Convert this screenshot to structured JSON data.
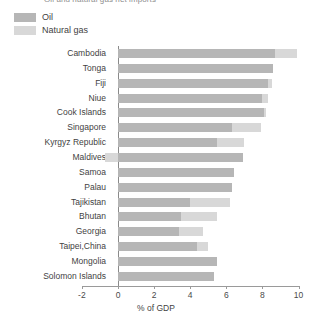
{
  "title": {
    "text": "Oil and natural gas net imports"
  },
  "legend": {
    "position": "top-left",
    "items": [
      {
        "label": "Oil",
        "color": "#b6b6b6",
        "key": "oil"
      },
      {
        "label": "Natural gas",
        "color": "#d8d8d8",
        "key": "gas"
      }
    ]
  },
  "axis": {
    "x_label": "% of GDP",
    "ticks": [
      "-2",
      "0",
      "2",
      "4",
      "6",
      "8",
      "10"
    ],
    "min": -2,
    "max": 10,
    "step": 2
  },
  "chart_data": {
    "type": "bar",
    "orientation": "horizontal",
    "stacked": true,
    "title": "Oil and natural gas net imports",
    "xlabel": "% of GDP",
    "ylabel": "",
    "xlim": [
      -2,
      10
    ],
    "grid": false,
    "legend_position": "top-left",
    "categories": [
      "Cambodia",
      "Tonga",
      "Fiji",
      "Niue",
      "Cook Islands",
      "Singapore",
      "Kyrgyz Republic",
      "Maldives",
      "Samoa",
      "Palau",
      "Tajikistan",
      "Bhutan",
      "Georgia",
      "Taipei,China",
      "Mongolia",
      "Solomon Islands"
    ],
    "series": [
      {
        "name": "Oil",
        "color": "#b6b6b6",
        "values": [
          8.7,
          8.6,
          8.3,
          8.0,
          8.1,
          6.3,
          5.5,
          6.9,
          6.4,
          6.3,
          4.0,
          3.5,
          3.4,
          4.4,
          5.5,
          5.3
        ]
      },
      {
        "name": "Natural gas",
        "color": "#d8d8d8",
        "values": [
          1.2,
          0.0,
          0.25,
          0.3,
          0.1,
          1.6,
          1.5,
          -0.7,
          0.0,
          0.0,
          2.2,
          2.0,
          1.3,
          0.6,
          0.0,
          0.0
        ]
      }
    ],
    "totals": [
      9.9,
      8.6,
      8.55,
      8.3,
      8.2,
      7.9,
      7.0,
      6.2,
      6.4,
      6.3,
      6.2,
      5.5,
      4.7,
      5.0,
      5.5,
      5.3
    ]
  }
}
